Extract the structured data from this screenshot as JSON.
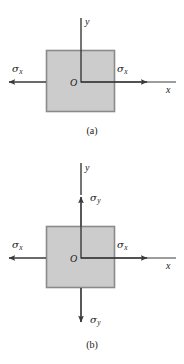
{
  "figure": {
    "colors": {
      "element_fill": "#cccccc",
      "element_stroke": "#808080",
      "line": "#3a3a3a",
      "background": "#ffffff"
    }
  },
  "panels": [
    {
      "id": "a",
      "caption": "(a)",
      "origin_label": "O",
      "axes": [
        {
          "name": "y-axis",
          "label": "y",
          "direction": "up"
        },
        {
          "name": "x-axis",
          "label": "x",
          "direction": "right"
        }
      ],
      "stress_arrows": [
        {
          "name": "sigma-x-left",
          "symbol": "σ",
          "subscript": "x",
          "direction": "left"
        },
        {
          "name": "sigma-x-right",
          "symbol": "σ",
          "subscript": "x",
          "direction": "right"
        }
      ]
    },
    {
      "id": "b",
      "caption": "(b)",
      "origin_label": "O",
      "axes": [
        {
          "name": "y-axis",
          "label": "y",
          "direction": "up"
        },
        {
          "name": "x-axis",
          "label": "x",
          "direction": "right"
        }
      ],
      "stress_arrows": [
        {
          "name": "sigma-x-left",
          "symbol": "σ",
          "subscript": "x",
          "direction": "left"
        },
        {
          "name": "sigma-x-right",
          "symbol": "σ",
          "subscript": "x",
          "direction": "right"
        },
        {
          "name": "sigma-y-top",
          "symbol": "σ",
          "subscript": "y",
          "direction": "up"
        },
        {
          "name": "sigma-y-bottom",
          "symbol": "σ",
          "subscript": "y",
          "direction": "down"
        }
      ]
    }
  ]
}
